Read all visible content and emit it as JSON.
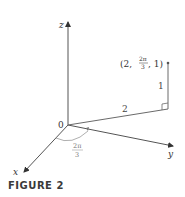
{
  "figure": {
    "caption": "FIGURE 2",
    "axes": {
      "x_label": "x",
      "y_label": "y",
      "z_label": "z",
      "origin_label": "0"
    },
    "point": {
      "label_open": "(2, ",
      "theta_num": "2π",
      "theta_den": "3",
      "label_close": ", 1)"
    },
    "segments": {
      "radius_label": "2",
      "height_label": "1"
    },
    "angle": {
      "num": "2π",
      "den": "3"
    },
    "colors": {
      "axis": "#555555",
      "line": "#6a6a6a",
      "text": "#333333",
      "arc": "#9a9a9a"
    }
  }
}
